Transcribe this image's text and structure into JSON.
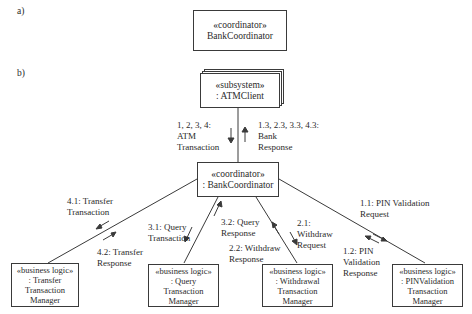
{
  "part_a": {
    "label": "a)",
    "object": {
      "stereotype": "«coordinator»",
      "name": "BankCoordinator"
    }
  },
  "part_b": {
    "label": "b)",
    "atm_client": {
      "stereotype": "«subsystem»",
      "name": ": ATMClient"
    },
    "bank_coordinator": {
      "stereotype": "«coordinator»",
      "name": ": BankCoordinator"
    },
    "transfer_manager": {
      "stereotype": "«business logic»",
      "lines": [
        ": Transfer",
        "Transaction",
        "Manager"
      ]
    },
    "query_manager": {
      "stereotype": "«business logic»",
      "lines": [
        ": Query",
        "Transaction",
        "Manager"
      ]
    },
    "withdrawal_manager": {
      "stereotype": "«business logic»",
      "lines": [
        ": Withdrawal",
        "Transaction",
        "Manager"
      ]
    },
    "pin_manager": {
      "stereotype": "«business logic»",
      "lines": [
        ": PINValidation",
        "Transaction",
        "Manager"
      ]
    },
    "messages": {
      "atm_transaction": "1, 2, 3, 4:\nATM\nTransaction",
      "bank_response": "1.3, 2.3, 3.3, 4.3:\nBank\nResponse",
      "transfer_transaction": "4.1: Transfer\nTransaction",
      "transfer_response": "4.2: Transfer\nResponse",
      "query_transaction": "3.1: Query\nTransaction",
      "query_response": "3.2: Query\nResponse",
      "withdraw_request": "2.1:\nWithdraw\nRequest",
      "withdraw_response": "2.2: Withdraw\nResponse",
      "pin_request": "1.1: PIN Validation\nRequest",
      "pin_response": "1.2: PIN\nValidation\nResponse"
    }
  }
}
